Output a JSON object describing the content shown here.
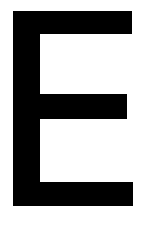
{
  "glyph": {
    "character": "E",
    "color": "#000000",
    "background": "#ffffff"
  }
}
